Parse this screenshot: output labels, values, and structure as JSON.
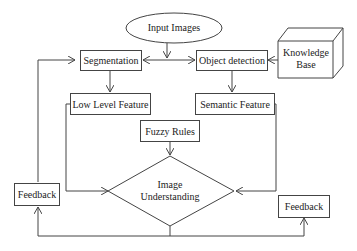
{
  "diagram": {
    "nodes": {
      "input": {
        "label": "Input Images",
        "shape": "ellipse"
      },
      "segmentation": {
        "label": "Segmentation",
        "shape": "rect"
      },
      "object_detection": {
        "label": "Object detection",
        "shape": "rect"
      },
      "knowledge_base": {
        "line1": "Knowledge",
        "line2": "Base",
        "shape": "cube"
      },
      "low_level": {
        "label": "Low Level Feature",
        "shape": "rect"
      },
      "semantic": {
        "label": "Semantic Feature",
        "shape": "rect"
      },
      "fuzzy_rules": {
        "label": "Fuzzy Rules",
        "shape": "rect"
      },
      "understanding": {
        "line1": "Image",
        "line2": "Understanding",
        "shape": "diamond"
      },
      "feedback_left": {
        "label": "Feedback",
        "shape": "rect"
      },
      "feedback_right": {
        "label": "Feedback",
        "shape": "rect"
      }
    },
    "edges": [
      {
        "from": "input",
        "to": "segmentation"
      },
      {
        "from": "input",
        "to": "object_detection"
      },
      {
        "from": "knowledge_base",
        "to": "object_detection"
      },
      {
        "from": "segmentation",
        "to": "low_level"
      },
      {
        "from": "object_detection",
        "to": "semantic"
      },
      {
        "from": "low_level",
        "to": "understanding"
      },
      {
        "from": "semantic",
        "to": "understanding"
      },
      {
        "from": "fuzzy_rules",
        "to": "understanding"
      },
      {
        "from": "understanding",
        "to": "feedback_left"
      },
      {
        "from": "understanding",
        "to": "feedback_right"
      },
      {
        "from": "feedback_left",
        "to": "segmentation"
      }
    ],
    "colors": {
      "stroke": "#444444",
      "fill": "#ffffff",
      "text": "#222222"
    }
  }
}
